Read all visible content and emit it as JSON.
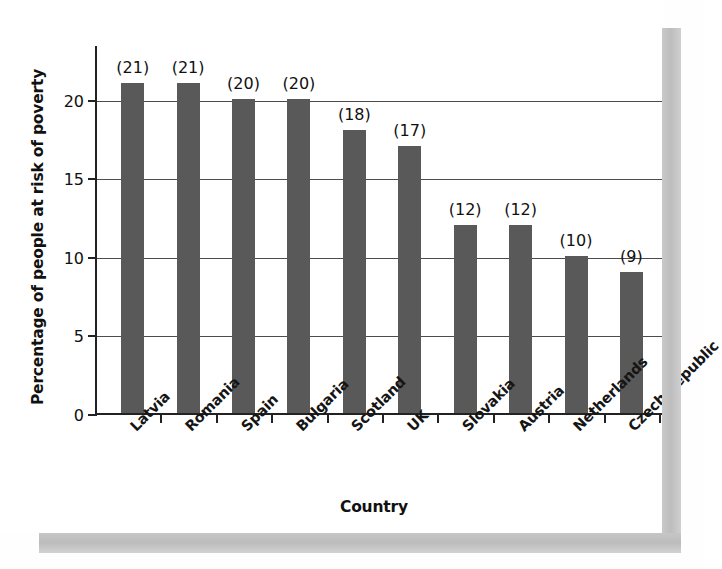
{
  "chart_data": {
    "type": "bar",
    "title": "",
    "xlabel": "Country",
    "ylabel": "Percentage of people at risk of poverty",
    "categories": [
      "Latvia",
      "Romania",
      "Spain",
      "Bulgaria",
      "Scotland",
      "UK",
      "Slovakia",
      "Austria",
      "Netherlands",
      "Czech Republic"
    ],
    "values": [
      21,
      21,
      20,
      20,
      18,
      17,
      12,
      12,
      10,
      9
    ],
    "value_labels": [
      "(21)",
      "(21)",
      "(20)",
      "(20)",
      "(18)",
      "(17)",
      "(12)",
      "(12)",
      "(10)",
      "(9)"
    ],
    "ylim": [
      0,
      23.5
    ],
    "yticks": [
      0,
      5,
      10,
      15,
      20
    ],
    "ytick_labels": [
      "0",
      "5",
      "10",
      "15",
      "20"
    ],
    "grid": "horizontal",
    "legend": "none",
    "bar_color": "#595959",
    "axis_color": "#222222",
    "gridline_color": "#4c4c4c",
    "background_color": "#ffffff"
  },
  "artifacts": {
    "ghost_text": "scanned",
    "shadow_color": "#c6c6c6"
  }
}
